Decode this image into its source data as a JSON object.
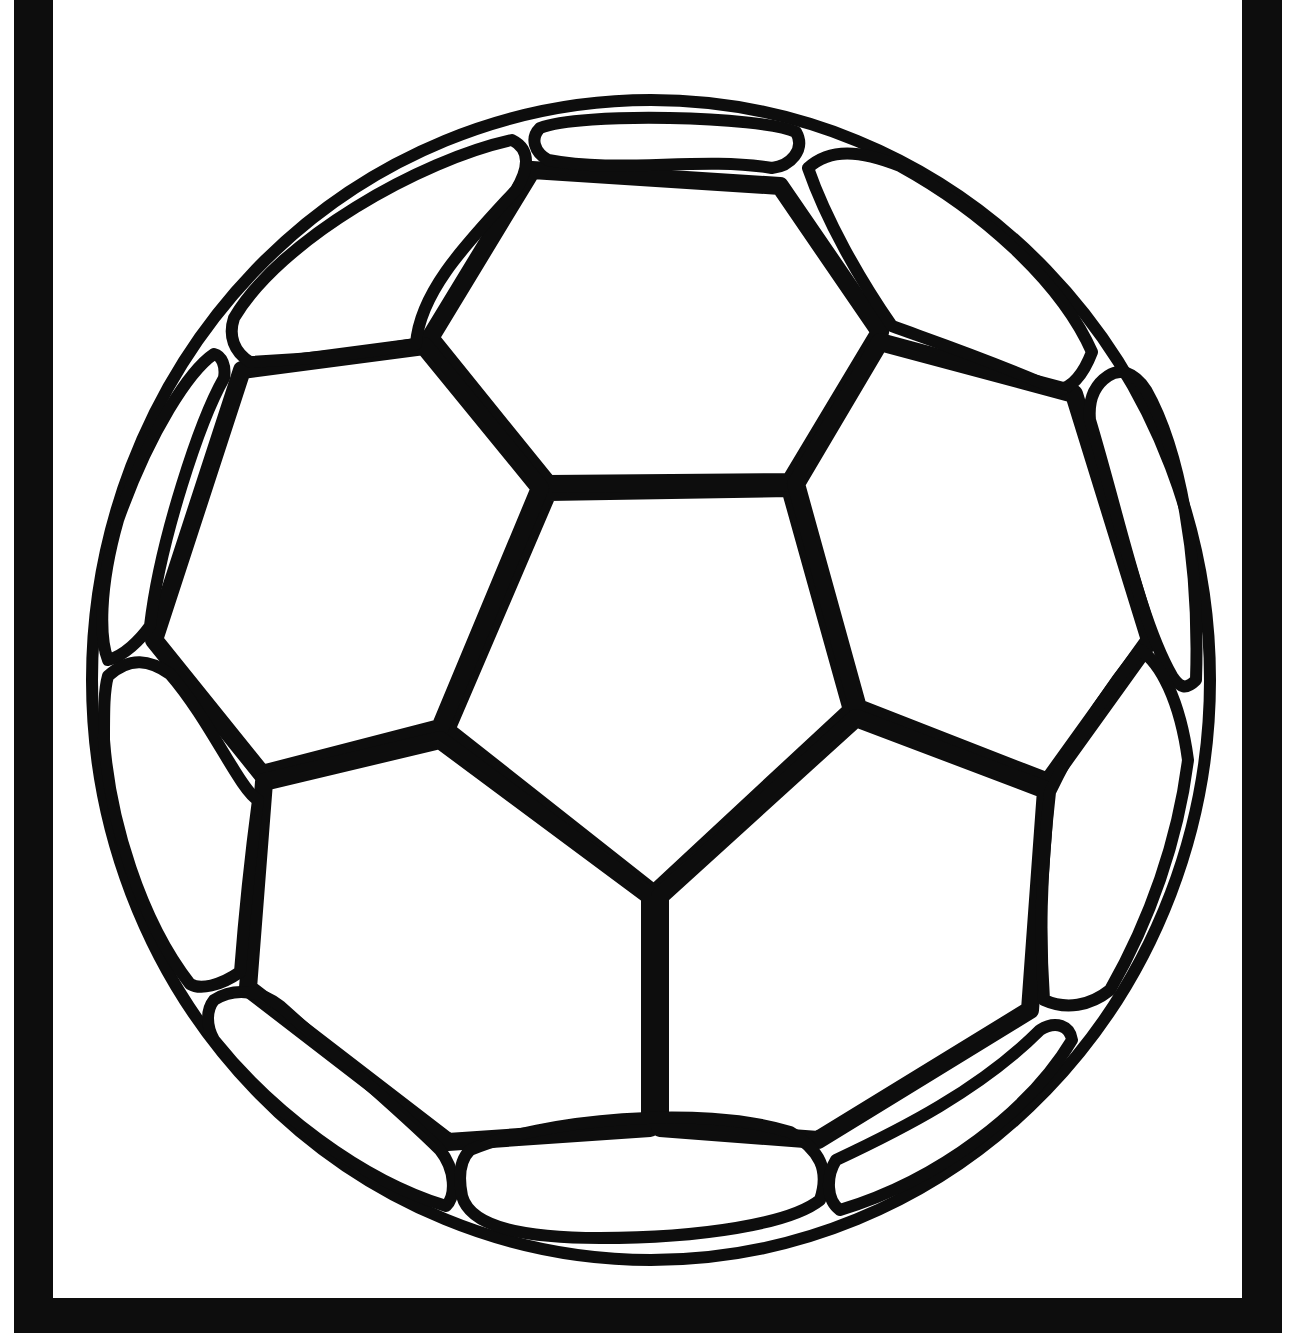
{
  "image": {
    "subject": "soccer ball coloring page",
    "description": "Black-outline soccer ball (line art) inside a thick black frame open at the top",
    "colors": {
      "ink": "#0d0d0d",
      "paper": "#ffffff"
    }
  }
}
